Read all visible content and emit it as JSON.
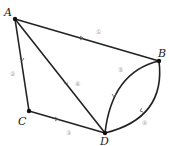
{
  "diagram": {
    "type": "graph",
    "vertices": [
      {
        "id": "A",
        "label": "A",
        "x": 15,
        "y": 19,
        "lx": 4,
        "ly": 16
      },
      {
        "id": "B",
        "label": "B",
        "x": 159,
        "y": 61,
        "lx": 160,
        "ly": 56
      },
      {
        "id": "C",
        "label": "C",
        "x": 29,
        "y": 111,
        "lx": 18,
        "ly": 123
      },
      {
        "id": "D",
        "label": "D",
        "x": 105,
        "y": 133,
        "lx": 99,
        "ly": 146
      }
    ],
    "edges": [
      {
        "id": "e1",
        "label": "①",
        "from": "A",
        "to": "B",
        "lx": 99,
        "ly": 35
      },
      {
        "id": "e2",
        "label": "②",
        "from": "A",
        "to": "C",
        "lx": 9,
        "ly": 74
      },
      {
        "id": "e3",
        "label": "③",
        "from": "C",
        "to": "D",
        "lx": 66,
        "ly": 133
      },
      {
        "id": "e4",
        "label": "④",
        "from": "B",
        "to": "D",
        "curve": "lower",
        "lx": 143,
        "ly": 126
      },
      {
        "id": "e5",
        "label": "⑤",
        "from": "B",
        "to": "D",
        "curve": "upper",
        "lx": 119,
        "ly": 72
      },
      {
        "id": "e6",
        "label": "⑥",
        "from": "A",
        "to": "D",
        "lx": 76,
        "ly": 86
      }
    ]
  }
}
